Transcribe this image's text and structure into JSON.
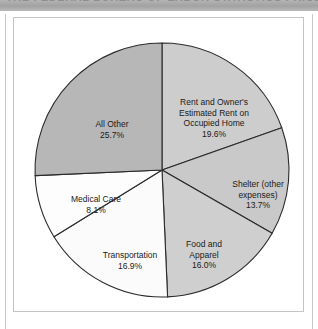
{
  "header": {
    "band_text": "THE FEDERAL BUREAU OF LABOR STATISTICS PRICE INDEX MEASURES"
  },
  "chart_data": {
    "type": "pie",
    "title": "",
    "subtitle": "",
    "xlabel": "",
    "ylabel": "",
    "legend_position": "none",
    "grid": false,
    "start_angle_deg": 0,
    "direction": "clockwise",
    "units": "percent",
    "total": 100.0,
    "categories": [
      "Rent and Owner's Estimated Rent on Occupied Home",
      "Shelter (other expenses)",
      "Food and Apparel",
      "Transportation",
      "Medical Care",
      "All Other"
    ],
    "values": [
      19.6,
      13.7,
      16.0,
      16.9,
      8.1,
      25.7
    ],
    "colors": [
      "#cdcdcd",
      "#c9c9c9",
      "#cfcfcf",
      "#fbfbfb",
      "#fdfdfd",
      "#b7b7b7"
    ],
    "slices": [
      {
        "name": "rent-and-owners-estimated-rent",
        "label_lines": [
          "Rent and Owner's",
          "Estimated Rent on",
          "Occupied Home"
        ],
        "label_text": "Rent and Owner's Estimated Rent on Occupied Home",
        "value": 19.6,
        "value_label": "19.6%",
        "color": "#cdcdcd"
      },
      {
        "name": "shelter-other-expenses",
        "label_lines": [
          "Shelter (other",
          "expenses)"
        ],
        "label_text": "Shelter (other expenses)",
        "value": 13.7,
        "value_label": "13.7%",
        "color": "#c9c9c9"
      },
      {
        "name": "food-and-apparel",
        "label_lines": [
          "Food and",
          "Apparel"
        ],
        "label_text": "Food and Apparel",
        "value": 16.0,
        "value_label": "16.0%",
        "color": "#cfcfcf"
      },
      {
        "name": "transportation",
        "label_lines": [
          "Transportation"
        ],
        "label_text": "Transportation",
        "value": 16.9,
        "value_label": "16.9%",
        "color": "#fbfbfb"
      },
      {
        "name": "medical-care",
        "label_lines": [
          "Medical Care"
        ],
        "label_text": "Medical Care",
        "value": 8.1,
        "value_label": "8.1%",
        "color": "#fdfdfd"
      },
      {
        "name": "all-other",
        "label_lines": [
          "All Other"
        ],
        "label_text": "All Other",
        "value": 25.7,
        "value_label": "25.7%",
        "color": "#b7b7b7"
      }
    ],
    "geometry": {
      "center_x": 148,
      "center_y": 152,
      "radius": 127,
      "stroke_color": "#2b2b2b",
      "stroke_width": 1.1
    }
  }
}
